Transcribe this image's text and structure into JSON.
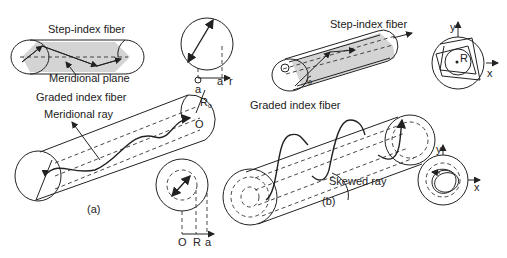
{
  "panel_a": {
    "caption": "(a)",
    "step_index_label": "Step-index fiber",
    "meridional_plane_label": "Meridional plane",
    "graded_index_label": "Graded index fiber",
    "meridional_ray_label": "Meridional ray",
    "step_cross_section": {
      "origin": "O",
      "radius": "a",
      "axis": "r"
    },
    "graded_end_labels": {
      "top": "a",
      "radius": "R",
      "radius_sub": "o",
      "origin": "O"
    },
    "graded_cross_section": {
      "origin": "O",
      "inner": "R",
      "outer": "a"
    }
  },
  "panel_b": {
    "caption": "(b)",
    "step_index_label": "Step-index fiber",
    "graded_index_label": "Graded index fiber",
    "skewed_ray_label": "Skewed ray",
    "angle_label": "θ",
    "step_cross_section": {
      "y_axis": "y",
      "x_axis": "x",
      "caustic": "R"
    },
    "graded_cross_section": {
      "y_axis": "y",
      "x_axis": "x"
    }
  },
  "colors": {
    "ink": "#222222",
    "shade": "#d4d4d4",
    "background": "#ffffff"
  }
}
